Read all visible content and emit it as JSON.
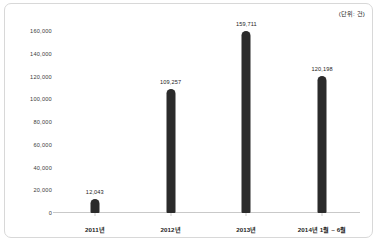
{
  "chart_data": {
    "type": "bar",
    "title": "",
    "subtitle": "",
    "unit_label": "(단위: 건)",
    "categories": [
      "2011년",
      "2012년",
      "2013년",
      "2014년 1월 ~ 6월"
    ],
    "values": [
      12043,
      109257,
      159711,
      120198
    ],
    "value_labels": [
      "12,043",
      "109,257",
      "159,711",
      "120,198"
    ],
    "series": [
      {
        "name": "",
        "values": [
          12043,
          109257,
          159711,
          120198
        ],
        "color": "#2b2b2b"
      }
    ],
    "xlabel": "",
    "ylabel": "",
    "ylim": [
      0,
      160000
    ],
    "ytick_values": [
      0,
      20000,
      40000,
      60000,
      80000,
      100000,
      120000,
      140000,
      160000
    ],
    "ytick_labels": [
      "0",
      "20,000",
      "40,000",
      "60,000",
      "80,000",
      "100,000",
      "120,000",
      "140,000",
      "160,000"
    ],
    "grid": false,
    "legend": false,
    "legend_position": "none",
    "bar_color": "#2b2b2b",
    "axis_color": "#c9c9c9",
    "frame_color": "#d8d8d8",
    "background": "#ffffff"
  }
}
